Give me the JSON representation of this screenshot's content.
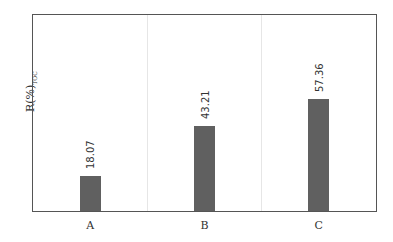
{
  "chart_data": {
    "type": "bar",
    "title": "",
    "xlabel": "",
    "ylabel": "R(%)_TOC",
    "ylabel_main": "R(%)",
    "ylabel_sub": "TOC",
    "categories": [
      "A",
      "B",
      "C"
    ],
    "values": [
      18.07,
      43.21,
      57.36
    ],
    "value_labels": [
      "18.07",
      "43.21",
      "57.36"
    ],
    "ylim": [
      0,
      100
    ],
    "grid": {
      "x": true,
      "y": false
    },
    "bar_color": "#606060",
    "legend": null
  }
}
